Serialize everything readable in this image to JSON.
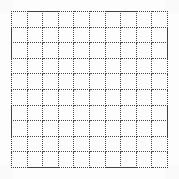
{
  "canvas": {
    "width": 179,
    "height": 179,
    "background_color": "#fdfdfd"
  },
  "grid": {
    "name": "dotted-square-grid",
    "columns": 10,
    "rows": 10,
    "total_cells": 100,
    "line_style": "dotted",
    "line_color": "#4a4a4a",
    "outline_color": "#3c3c3c",
    "cell_fill": "transparent",
    "left": 11,
    "top": 11,
    "width": 157,
    "height": 157,
    "cell_width": 15.7,
    "cell_height": 15.7,
    "column_labels": [
      "1",
      "2",
      "3",
      "4",
      "5",
      "6",
      "7",
      "8",
      "9",
      "10"
    ],
    "row_labels": [
      "1",
      "2",
      "3",
      "4",
      "5",
      "6",
      "7",
      "8",
      "9",
      "10"
    ],
    "cells": [
      [
        "",
        "",
        "",
        "",
        "",
        "",
        "",
        "",
        "",
        ""
      ],
      [
        "",
        "",
        "",
        "",
        "",
        "",
        "",
        "",
        "",
        ""
      ],
      [
        "",
        "",
        "",
        "",
        "",
        "",
        "",
        "",
        "",
        ""
      ],
      [
        "",
        "",
        "",
        "",
        "",
        "",
        "",
        "",
        "",
        ""
      ],
      [
        "",
        "",
        "",
        "",
        "",
        "",
        "",
        "",
        "",
        ""
      ],
      [
        "",
        "",
        "",
        "",
        "",
        "",
        "",
        "",
        "",
        ""
      ],
      [
        "",
        "",
        "",
        "",
        "",
        "",
        "",
        "",
        "",
        ""
      ],
      [
        "",
        "",
        "",
        "",
        "",
        "",
        "",
        "",
        "",
        ""
      ],
      [
        "",
        "",
        "",
        "",
        "",
        "",
        "",
        "",
        "",
        ""
      ],
      [
        "",
        "",
        "",
        "",
        "",
        "",
        "",
        "",
        "",
        ""
      ]
    ]
  }
}
